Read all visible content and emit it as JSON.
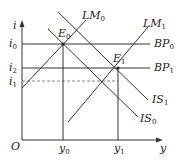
{
  "diagram": {
    "axes": {
      "y_label": "i",
      "x_label": "y",
      "origin_label": "O"
    },
    "y_ticks": [
      {
        "base": "i",
        "sub": "0"
      },
      {
        "base": "i",
        "sub": "2"
      },
      {
        "base": "i",
        "sub": "1"
      }
    ],
    "x_ticks": [
      {
        "base": "y",
        "sub": "0"
      },
      {
        "base": "y",
        "sub": "1"
      }
    ],
    "curves": {
      "lm0": {
        "base": "LM",
        "sub": "0"
      },
      "lm1": {
        "base": "LM",
        "sub": "1"
      },
      "bp0": {
        "base": "BP",
        "sub": "0"
      },
      "bp1": {
        "base": "BP",
        "sub": "1"
      },
      "is0": {
        "base": "IS",
        "sub": "0"
      },
      "is1": {
        "base": "IS",
        "sub": "1"
      }
    },
    "points": {
      "e0": {
        "base": "E",
        "sub": "0"
      },
      "e1": {
        "base": "E",
        "sub": "1"
      }
    },
    "line_color": "#333333"
  }
}
